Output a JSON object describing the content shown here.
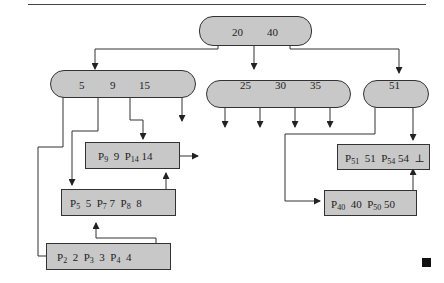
{
  "diagram": {
    "type": "b-plus-tree-index",
    "root": {
      "keys": [
        "20",
        "40"
      ]
    },
    "internal_nodes": [
      {
        "id": "left",
        "keys": [
          "5",
          "9",
          "15"
        ]
      },
      {
        "id": "middle",
        "keys": [
          "25",
          "30",
          "35"
        ]
      },
      {
        "id": "right",
        "keys": [
          "51"
        ]
      }
    ],
    "leaf_nodes": [
      {
        "id": "leaf-9-14",
        "entries": [
          {
            "ptr": "P",
            "sub": "9",
            "key": "9"
          },
          {
            "ptr": "P",
            "sub": "14",
            "key": "14"
          }
        ]
      },
      {
        "id": "leaf-5-7-8",
        "entries": [
          {
            "ptr": "P",
            "sub": "5",
            "key": "5"
          },
          {
            "ptr": "P",
            "sub": "7",
            "key": "7"
          },
          {
            "ptr": "P",
            "sub": "8",
            "key": "8"
          }
        ]
      },
      {
        "id": "leaf-2-3-4",
        "entries": [
          {
            "ptr": "P",
            "sub": "2",
            "key": "2"
          },
          {
            "ptr": "P",
            "sub": "3",
            "key": "3"
          },
          {
            "ptr": "P",
            "sub": "4",
            "key": "4"
          }
        ]
      },
      {
        "id": "leaf-51-54",
        "entries": [
          {
            "ptr": "P",
            "sub": "51",
            "key": "51"
          },
          {
            "ptr": "P",
            "sub": "54",
            "key": "54"
          }
        ],
        "terminator": "⊥"
      },
      {
        "id": "leaf-40-50",
        "entries": [
          {
            "ptr": "P",
            "sub": "40",
            "key": "40"
          },
          {
            "ptr": "P",
            "sub": "50",
            "key": "50"
          }
        ]
      }
    ],
    "colors": {
      "node_fill": "#c8c8c8",
      "stroke": "#333333",
      "end_mark": "#111111"
    }
  }
}
